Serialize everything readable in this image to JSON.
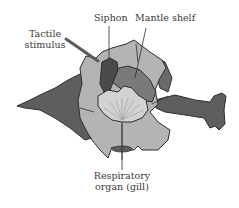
{
  "diagram": {
    "labels": {
      "siphon": "Siphon",
      "mantle_shelf": "Mantle shelf",
      "tactile_stimulus_line1": "Tactile",
      "tactile_stimulus_line2": "stimulus",
      "gill_line1": "Respiratory",
      "gill_line2": "organ (gill)"
    },
    "colors": {
      "body_dark": "#5e5e5e",
      "parapodia_light": "#b4b4b4",
      "mantle": "#7a7a7a",
      "siphon": "#4a4a4a",
      "gill": "#d2d2d2",
      "outline": "#2e2e2e",
      "text": "#3a3a3a"
    }
  }
}
